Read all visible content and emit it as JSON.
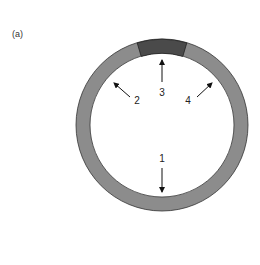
{
  "panel_label": "(a)",
  "ring": {
    "fill_color": "#8c8c8c",
    "segment_color": "#4a4a4a",
    "stroke_color": "#222222"
  },
  "arrows": [
    {
      "id": 1,
      "label": "1"
    },
    {
      "id": 2,
      "label": "2"
    },
    {
      "id": 3,
      "label": "3"
    },
    {
      "id": 4,
      "label": "4"
    }
  ]
}
